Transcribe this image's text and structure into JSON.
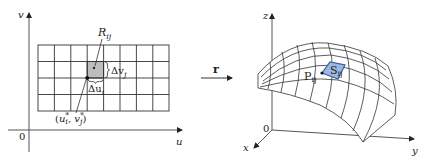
{
  "figure": {
    "left_panel": {
      "name": "uv-parameter-domain",
      "axis_labels": {
        "vertical": "v",
        "horizontal": "u",
        "origin": "0"
      },
      "grid": {
        "columns": 8,
        "rows": 4
      },
      "subrectangle_label": {
        "main": "R",
        "sub": "ij"
      },
      "delta_v_label": {
        "main": "Δv",
        "sub": "j"
      },
      "delta_u_label": {
        "main": "Δu",
        "sub": "i"
      },
      "sample_point_label": {
        "open": "(",
        "u": "u",
        "u_sup": "*",
        "u_sub": "i",
        "comma": ", ",
        "v": "v",
        "v_sup": "*",
        "v_sub": "j",
        "close": ")"
      },
      "highlight_color": "#bdbdbd"
    },
    "mapping_arrow": {
      "label": "r"
    },
    "right_panel": {
      "name": "parametric-surface",
      "axis_labels": {
        "z": "z",
        "x": "x",
        "y": "y",
        "origin": "0"
      },
      "surface_grid": {
        "columns": 8,
        "rows": 5
      },
      "point_label": {
        "main": "P",
        "sub": "ij"
      },
      "patch_label": {
        "main": "S",
        "sub": "ij"
      },
      "patch_fill_color": "#9cb8e0",
      "patch_stroke_color": "#3a5f9e"
    }
  }
}
